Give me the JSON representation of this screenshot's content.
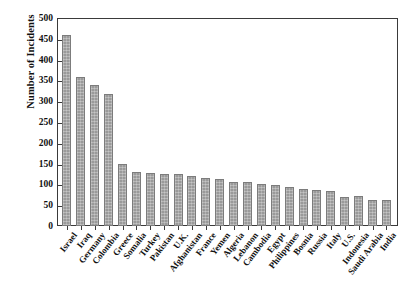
{
  "chart_data": {
    "type": "bar",
    "title": "",
    "subtitle": "",
    "xlabel": "",
    "ylabel": "Number of Incidents",
    "ylim": [
      0,
      500
    ],
    "ytick_step": 50,
    "yticks": [
      0,
      50,
      100,
      150,
      200,
      250,
      300,
      350,
      400,
      450,
      500
    ],
    "grid": false,
    "legend": null,
    "bar_color": "#9a9a9a",
    "bar_edge_color": "#7c7c7c",
    "axis_color": "#3a3a3a",
    "categories": [
      "Israel",
      "Iraq",
      "Germany",
      "Colombia",
      "Greece",
      "Somalia",
      "Turkey",
      "Pakistan",
      "U.K.",
      "Afghanistan",
      "France",
      "Yemen",
      "Algeria",
      "Lebanon",
      "Cambodia",
      "Egypt",
      "Philippines",
      "Bosnia",
      "Russia",
      "Italy",
      "U.S.",
      "Indonesia",
      "Saudi Arabia",
      "India"
    ],
    "values": [
      458,
      358,
      340,
      318,
      148,
      130,
      128,
      126,
      124,
      121,
      116,
      113,
      106,
      106,
      100,
      98,
      93,
      90,
      87,
      83,
      70,
      72,
      62,
      62
    ]
  }
}
